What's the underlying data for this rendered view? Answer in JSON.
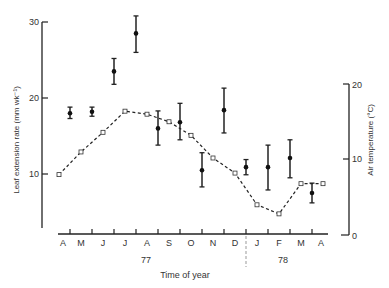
{
  "chart_data": {
    "type": "scatter",
    "title": "",
    "xlabel": "Time of year",
    "ylabel": "Leaf extension rate (mm wk⁻¹)",
    "y2label": "Air temperature (°C)",
    "ylim": [
      0,
      30
    ],
    "y2lim": [
      0,
      20
    ],
    "left_ticks": [
      "10",
      "20",
      "30"
    ],
    "right_ticks": [
      "0",
      "10",
      "20"
    ],
    "month_labels": [
      "A",
      "M",
      "J",
      "J",
      "A",
      "S",
      "O",
      "N",
      "D",
      "J",
      "F",
      "M",
      "A"
    ],
    "year_labels": [
      "77",
      "78"
    ],
    "grid": false,
    "series": [
      {
        "name": "Leaf extension rate",
        "axis": "left",
        "style": "filled circle with error bars",
        "x_index": [
          0.5,
          1.5,
          2.5,
          3.5,
          4.5,
          5.5,
          6.5,
          7.5,
          8.5,
          9.5,
          10.5,
          11.5
        ],
        "values": [
          18.0,
          18.2,
          23.5,
          28.5,
          16.0,
          16.8,
          10.5,
          18.4,
          10.9,
          10.9,
          12.1,
          7.5
        ],
        "err_low": [
          17.3,
          17.6,
          21.8,
          26.0,
          13.8,
          14.5,
          8.3,
          15.4,
          9.9,
          7.9,
          9.5,
          6.2
        ],
        "err_high": [
          18.8,
          18.8,
          25.2,
          30.8,
          18.3,
          19.3,
          12.8,
          21.3,
          11.9,
          13.8,
          14.5,
          8.8
        ]
      },
      {
        "name": "Air temperature",
        "axis": "right",
        "style": "open square dashed line",
        "x_index": [
          0,
          1,
          2,
          3,
          4,
          5,
          6,
          7,
          8,
          9,
          10,
          11,
          12
        ],
        "values": [
          8.0,
          11.0,
          13.6,
          16.4,
          16.0,
          15.0,
          13.2,
          10.2,
          8.2,
          4.0,
          2.8,
          6.8,
          6.8
        ]
      }
    ],
    "annotations": [
      "dashed vertical line between D and J separating 1977 and 1978"
    ]
  }
}
